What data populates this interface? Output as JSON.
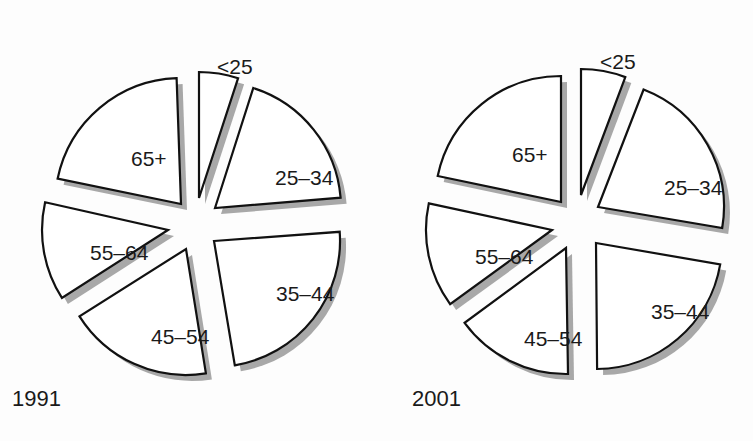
{
  "chart_data": [
    {
      "type": "pie",
      "title": "1991",
      "style": "exploded, white wedges with black outline and gray drop shadow",
      "categories": [
        "<25",
        "25–34",
        "35–44",
        "45–54",
        "55–64",
        "65+"
      ],
      "values": [
        5.0,
        19.0,
        23.8,
        18.7,
        12.7,
        21.0
      ],
      "unit": "approx. % share (estimated from wedge angles)",
      "wedges": [
        {
          "label": "<25",
          "start": 0.0,
          "end": 18.1,
          "apex": [
            199,
            198
          ],
          "labelPos": [
            217,
            58
          ]
        },
        {
          "label": "25–34",
          "start": 17.7,
          "end": 85.3,
          "apex": [
            215,
            208
          ],
          "labelPos": [
            275,
            169
          ]
        },
        {
          "label": "35–44",
          "start": 85.8,
          "end": 170.5,
          "apex": [
            214,
            241
          ],
          "labelPos": [
            276,
            285
          ]
        },
        {
          "label": "45–54",
          "start": 170.9,
          "end": 237.7,
          "apex": [
            186,
            249
          ],
          "labelPos": [
            151,
            328
          ]
        },
        {
          "label": "55–64",
          "start": 237.4,
          "end": 282.7,
          "apex": [
            168,
            230
          ],
          "labelPos": [
            90,
            244
          ]
        },
        {
          "label": "65+",
          "start": 281.6,
          "end": 358.0,
          "apex": [
            181,
            204
          ],
          "labelPos": [
            131,
            150
          ]
        }
      ],
      "radius": 126
    },
    {
      "type": "pie",
      "title": "2001",
      "style": "exploded, white wedges with black outline and gray drop shadow",
      "categories": [
        "<25",
        "25–34",
        "35–44",
        "45–54",
        "55–64",
        "65+"
      ],
      "values": [
        5.7,
        21.7,
        22.2,
        15.1,
        13.3,
        21.7
      ],
      "unit": "approx. % share (estimated from wedge angles)",
      "wedges": [
        {
          "label": "<25",
          "start": 0.0,
          "end": 20.6,
          "apex": [
            581,
            195
          ],
          "labelPos": [
            600,
            53
          ]
        },
        {
          "label": "25–34",
          "start": 21.2,
          "end": 99.6,
          "apex": [
            598,
            207
          ],
          "labelPos": [
            664,
            179
          ]
        },
        {
          "label": "35–44",
          "start": 99.8,
          "end": 179.5,
          "apex": [
            596,
            243
          ],
          "labelPos": [
            651,
            303
          ]
        },
        {
          "label": "45–54",
          "start": 179.1,
          "end": 233.6,
          "apex": [
            566,
            248
          ],
          "labelPos": [
            524,
            330
          ]
        },
        {
          "label": "55–64",
          "start": 234.0,
          "end": 282.2,
          "apex": [
            552,
            230
          ],
          "labelPos": [
            475,
            248
          ]
        },
        {
          "label": "65+",
          "start": 281.9,
          "end": 360.0,
          "apex": [
            561,
            202
          ],
          "labelPos": [
            512,
            146
          ]
        }
      ],
      "radius": 126
    }
  ],
  "labels": {
    "year_left": "1991",
    "year_right": "2001"
  },
  "colors": {
    "wedge_fill": "#ffffff",
    "wedge_stroke": "#111111",
    "shadow": "#a8a8a8",
    "background": "#fdfdfd"
  }
}
